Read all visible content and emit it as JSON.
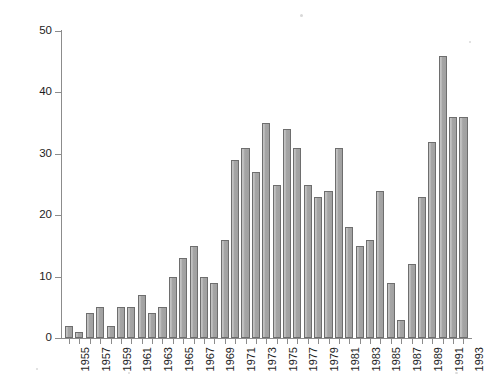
{
  "chart_data": {
    "type": "bar",
    "title": "",
    "xlabel": "",
    "ylabel": "Number of papers",
    "ylim": [
      0,
      50
    ],
    "ytick_values": [
      0,
      10,
      20,
      30,
      40,
      50
    ],
    "ytick_labels": [
      "0",
      "10",
      "20",
      "30",
      "40",
      "50"
    ],
    "grid": false,
    "legend": null,
    "xtick_labels": [
      "1955",
      "1957",
      "1959",
      "1961",
      "1963",
      "1965",
      "1967",
      "1969",
      "1971",
      "1973",
      "1975",
      "1977",
      "1979",
      "1981",
      "1983",
      "1985",
      "1987",
      "1989",
      "1991",
      "1993"
    ],
    "categories": [
      "1955",
      "1956",
      "1957",
      "1958",
      "1959",
      "1960",
      "1961",
      "1962",
      "1963",
      "1964",
      "1965",
      "1966",
      "1967",
      "1968",
      "1969",
      "1970",
      "1971",
      "1972",
      "1973",
      "1974",
      "1975",
      "1976",
      "1977",
      "1978",
      "1979",
      "1980",
      "1981",
      "1982",
      "1983",
      "1984",
      "1985",
      "1986",
      "1987",
      "1988",
      "1989",
      "1990",
      "1991",
      "1992",
      "1993"
    ],
    "values": [
      2,
      1,
      4,
      5,
      2,
      5,
      5,
      7,
      4,
      5,
      10,
      13,
      15,
      10,
      9,
      16,
      29,
      31,
      27,
      35,
      25,
      34,
      31,
      25,
      23,
      24,
      31,
      18,
      15,
      16,
      24,
      9,
      3,
      12,
      23,
      32,
      46,
      36,
      36
    ],
    "series_name": "Number of papers",
    "bar_fill_color": "#a9a9a9",
    "bar_edge_color": "#6e6e6e",
    "axis_color": "#8c8c8c",
    "background_color": "#ffffff"
  }
}
